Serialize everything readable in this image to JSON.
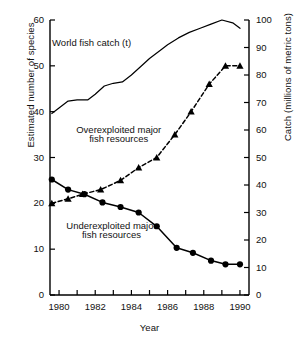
{
  "chart_data": {
    "type": "line",
    "title": "",
    "xlabel": "Year",
    "ylabel": "Estimated number of species",
    "ylabel_right": "Catch (millions of metric tons)",
    "xlim": [
      1979.5,
      1990.5
    ],
    "ylim": [
      0,
      60
    ],
    "ylim_right": [
      0,
      100
    ],
    "grid": false,
    "legend": "inline annotations",
    "x_ticks_major": [
      1980,
      1982,
      1984,
      1986,
      1988,
      1990
    ],
    "x_ticks_minor": [
      1981,
      1983,
      1985,
      1987,
      1989
    ],
    "x_tick_labels": [
      "1980",
      "1982",
      "1984",
      "1986",
      "1988",
      "1990"
    ],
    "y_ticks_left": [
      0,
      10,
      20,
      30,
      40,
      50,
      60
    ],
    "y_tick_labels_left": [
      "0",
      "10",
      "20",
      "30",
      "40",
      "50",
      "60"
    ],
    "y_ticks_right": [
      0,
      10,
      20,
      30,
      40,
      50,
      60,
      70,
      80,
      90,
      100
    ],
    "y_tick_labels_right": [
      "0",
      "10",
      "20",
      "30",
      "40",
      "50",
      "60",
      "70",
      "80",
      "90",
      "100"
    ],
    "series": [
      {
        "name": "World fish catch (t)",
        "axis": "right",
        "marker": "none",
        "dash": "solid",
        "color": "#000000",
        "x": [
          1979.6,
          1980.0,
          1980.5,
          1981.0,
          1981.6,
          1982.0,
          1982.5,
          1983.0,
          1983.5,
          1984.0,
          1984.5,
          1985.0,
          1985.6,
          1986.0,
          1986.6,
          1987.2,
          1987.8,
          1988.4,
          1989.0,
          1989.6,
          1990.0
        ],
        "values": [
          66,
          68,
          70.5,
          71,
          71,
          73,
          76,
          77,
          77.5,
          80,
          83,
          86,
          89,
          91,
          93.5,
          95.5,
          97,
          98.5,
          100,
          99,
          97
        ]
      },
      {
        "name": "Overexploited major fish resources",
        "axis": "left",
        "marker": "triangle",
        "dash": "dashed",
        "color": "#000000",
        "x": [
          1979.6,
          1980.5,
          1981.3,
          1982.3,
          1983.4,
          1984.4,
          1985.4,
          1986.4,
          1987.3,
          1988.3,
          1989.2,
          1990.0
        ],
        "values": [
          20,
          21,
          22,
          23,
          25,
          27.8,
          30,
          35,
          40,
          46,
          50,
          50
        ]
      },
      {
        "name": "Underexploited major fish resources",
        "axis": "left",
        "marker": "circle",
        "dash": "solid",
        "color": "#000000",
        "x": [
          1979.6,
          1980.5,
          1981.4,
          1982.4,
          1983.4,
          1984.4,
          1985.4,
          1986.5,
          1987.4,
          1988.4,
          1989.2,
          1990.0
        ],
        "values": [
          25.2,
          23,
          22,
          20.2,
          19.2,
          18,
          15,
          10.3,
          9.2,
          7.5,
          6.7,
          6.7
        ]
      }
    ],
    "annotations": [
      {
        "text": "World fish catch (t)",
        "x": 1981.8,
        "y": 55
      },
      {
        "text": "Overexploited major",
        "x": 1983.3,
        "y": 36
      },
      {
        "text": "fish resources",
        "x": 1983.3,
        "y": 34
      },
      {
        "text": "Underexploited major",
        "x": 1982.9,
        "y": 15
      },
      {
        "text": "fish resources",
        "x": 1982.9,
        "y": 13
      }
    ]
  },
  "axes": {
    "left_title": "Estimated number of species",
    "right_title": "Catch (millions of metric tons)",
    "x_title": "Year"
  },
  "tick_labels": {
    "left": [
      "60",
      "50",
      "40",
      "30",
      "20",
      "10",
      "0"
    ],
    "right": [
      "100",
      "90",
      "80",
      "70",
      "60",
      "50",
      "40",
      "30",
      "20",
      "10",
      "0"
    ],
    "bottom": [
      "1980",
      "1982",
      "1984",
      "1986",
      "1988",
      "1990"
    ]
  },
  "annotations": {
    "world_catch": "World fish catch (t)",
    "over_line1": "Overexploited major",
    "over_line2": "fish resources",
    "under_line1": "Underexploited major",
    "under_line2": "fish resources"
  }
}
